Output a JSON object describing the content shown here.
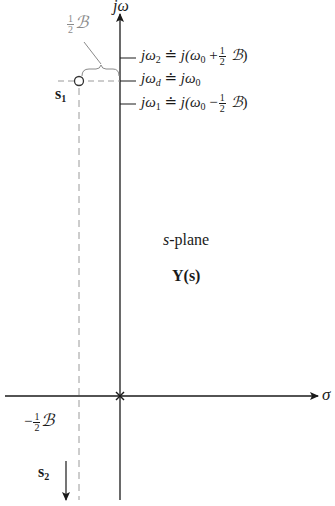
{
  "diagram": {
    "title": "s-plane",
    "function_label": "Y(s)",
    "axes": {
      "vertical_label": "jω",
      "horizontal_label": "σ"
    },
    "poles": [
      {
        "name": "s1",
        "label_main": "s",
        "label_sub": "1"
      },
      {
        "name": "s2",
        "label_main": "s",
        "label_sub": "2"
      }
    ],
    "bandwidth_label": {
      "frac_num": "1",
      "frac_den": "2",
      "symbol": "ℬ"
    },
    "neg_bandwidth_label": {
      "sign": "−",
      "frac_num": "1",
      "frac_den": "2",
      "symbol": "ℬ"
    },
    "frequency_marks": [
      {
        "id": "omega2",
        "lhs": "jω",
        "lhs_sub": "2",
        "rel": "≐",
        "rhs_pre": "j(ω",
        "rhs_sub": "0",
        "op": "+",
        "frac_num": "1",
        "frac_den": "2",
        "symbol": "ℬ",
        "close": ")"
      },
      {
        "id": "omegad",
        "lhs": "jω",
        "lhs_sub": "d",
        "rel": "≐",
        "rhs_pre": "jω",
        "rhs_sub": "0"
      },
      {
        "id": "omega1",
        "lhs": "jω",
        "lhs_sub": "1",
        "rel": "≐",
        "rhs_pre": "j(ω",
        "rhs_sub": "0",
        "op": "−",
        "frac_num": "1",
        "frac_den": "2",
        "symbol": "ℬ",
        "close": ")"
      }
    ],
    "colors": {
      "axis": "#1a1a1a",
      "annotation": "#8a8a8a",
      "dashed": "#9a9a9a"
    }
  }
}
